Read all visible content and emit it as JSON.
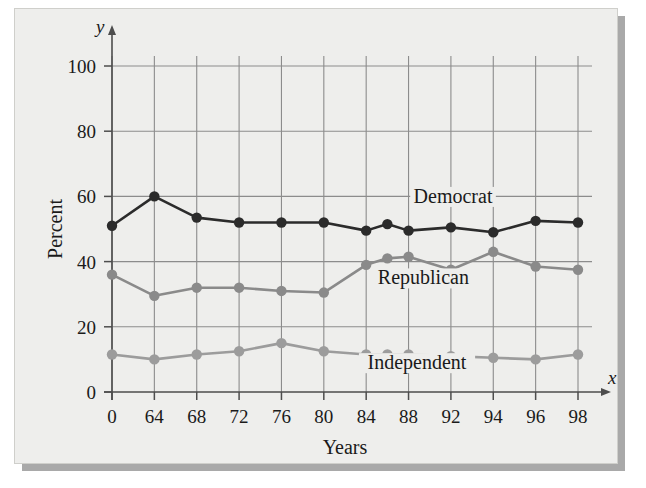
{
  "figure": {
    "background_color": "#eeeeec",
    "shadow_color": "#a9a9a9",
    "grid_color": "#8c8c8c",
    "axis_color": "#4d4d4d"
  },
  "axes": {
    "y_axis_letter": "y",
    "x_axis_letter": "x",
    "y_axis_title": "Percent",
    "x_axis_title": "Years",
    "y_ticks": [
      "0",
      "20",
      "40",
      "60",
      "80",
      "100"
    ],
    "x_ticks": [
      "0",
      "64",
      "68",
      "72",
      "76",
      "80",
      "84",
      "88",
      "92",
      "94",
      "96",
      "98"
    ]
  },
  "chart_data": {
    "type": "line",
    "title": "",
    "xlabel": "Years",
    "ylabel": "Percent",
    "xlim": [
      0,
      11
    ],
    "ylim": [
      0,
      100
    ],
    "grid": true,
    "legend": "inline-annotation",
    "categories": [
      "0",
      "64",
      "68",
      "72",
      "76",
      "80",
      "84",
      "88",
      "92",
      "94",
      "96",
      "98"
    ],
    "series": [
      {
        "name": "Democrat",
        "color": "#2b2b2b",
        "label_x": 8.05,
        "label_y": 58,
        "points": [
          {
            "x": 0.0,
            "y": 51
          },
          {
            "x": 1.0,
            "y": 60
          },
          {
            "x": 2.0,
            "y": 53.5
          },
          {
            "x": 3.0,
            "y": 52
          },
          {
            "x": 4.0,
            "y": 52
          },
          {
            "x": 5.0,
            "y": 52
          },
          {
            "x": 6.0,
            "y": 49.5
          },
          {
            "x": 6.5,
            "y": 51.5
          },
          {
            "x": 7.0,
            "y": 49.5
          },
          {
            "x": 8.0,
            "y": 50.5
          },
          {
            "x": 9.0,
            "y": 49
          },
          {
            "x": 10.0,
            "y": 52.5
          },
          {
            "x": 11.0,
            "y": 52
          }
        ]
      },
      {
        "name": "Republican",
        "color": "#8a8a8a",
        "label_x": 7.35,
        "label_y": 33,
        "points": [
          {
            "x": 0.0,
            "y": 36
          },
          {
            "x": 1.0,
            "y": 29.5
          },
          {
            "x": 2.0,
            "y": 32
          },
          {
            "x": 3.0,
            "y": 32
          },
          {
            "x": 4.0,
            "y": 31
          },
          {
            "x": 5.0,
            "y": 30.5
          },
          {
            "x": 6.0,
            "y": 39
          },
          {
            "x": 6.5,
            "y": 41
          },
          {
            "x": 7.0,
            "y": 41.5
          },
          {
            "x": 8.0,
            "y": 37.5
          },
          {
            "x": 9.0,
            "y": 43
          },
          {
            "x": 10.0,
            "y": 38.5
          },
          {
            "x": 11.0,
            "y": 37.5
          }
        ]
      },
      {
        "name": "Independent",
        "color": "#9c9c9c",
        "label_x": 7.2,
        "label_y": 7,
        "points": [
          {
            "x": 0.0,
            "y": 11.5
          },
          {
            "x": 1.0,
            "y": 10
          },
          {
            "x": 2.0,
            "y": 11.5
          },
          {
            "x": 3.0,
            "y": 12.5
          },
          {
            "x": 4.0,
            "y": 15
          },
          {
            "x": 5.0,
            "y": 12.5
          },
          {
            "x": 6.0,
            "y": 11.5
          },
          {
            "x": 6.5,
            "y": 11.5
          },
          {
            "x": 7.0,
            "y": 11.5
          },
          {
            "x": 8.0,
            "y": 11
          },
          {
            "x": 9.0,
            "y": 10.5
          },
          {
            "x": 10.0,
            "y": 10
          },
          {
            "x": 11.0,
            "y": 11.5
          }
        ]
      }
    ]
  }
}
